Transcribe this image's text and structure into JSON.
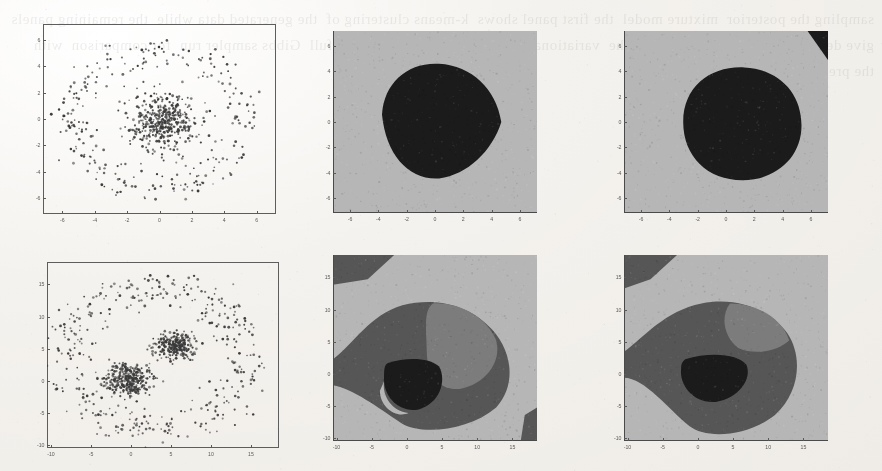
{
  "page": {
    "kind": "scanned-figure-page",
    "ghost_text": "sampling the posterior  mixture model  the first panel shows  k-means clustering of  the generated data while  the remaining panels  give decision regions  obtained from the  variational approximation  and from the full  Gibbs sampler run  for comparison  with  the predictive density",
    "background_color": "#f2f0ec",
    "ink_color": "#3a3a3a"
  },
  "figure": {
    "panels": [
      {
        "id": "panel-top-left",
        "name": "scatter-two-ring",
        "type": "scatter",
        "x": 43,
        "y": 24,
        "w": 233,
        "h": 190,
        "chart_data": {
          "type": "scatter",
          "title": "",
          "xlabel": "",
          "ylabel": "",
          "grid": false,
          "legend": null,
          "xlim": [
            -7.2,
            7.2
          ],
          "ylim": [
            -7.2,
            7.2
          ],
          "xticks": [
            -6,
            -4,
            -2,
            0,
            2,
            4,
            6
          ],
          "yticks": [
            -6,
            -4,
            -2,
            0,
            2,
            4,
            6
          ],
          "marker": "dot",
          "marker_color": "#3a3a3a",
          "marker_size": 1.1,
          "clusters": [
            {
              "name": "core-gaussian",
              "kind": "gaussian",
              "cx": 0.15,
              "cy": -0.1,
              "sx": 1.05,
              "sy": 1.05,
              "n": 430
            },
            {
              "name": "outer-ring",
              "kind": "ring",
              "cx": 0.0,
              "cy": 0.0,
              "r": 5.2,
              "rjitter": 0.62,
              "n": 260
            }
          ]
        }
      },
      {
        "id": "panel-top-mid",
        "name": "decision-region-two-class-a",
        "type": "region",
        "x": 333,
        "y": 31,
        "w": 204,
        "h": 182,
        "chart_data": {
          "type": "heatmap",
          "title": "",
          "xlabel": "",
          "ylabel": "",
          "grid": false,
          "xlim": [
            -7.2,
            7.2
          ],
          "ylim": [
            -7.2,
            7.2
          ],
          "xticks": [
            -6,
            -4,
            -2,
            0,
            2,
            4,
            6
          ],
          "yticks": [
            -6,
            -4,
            -2,
            0,
            2,
            4,
            6
          ],
          "levels": [
            {
              "label": "outer region",
              "color": "#b6b6b6"
            },
            {
              "label": "inner region",
              "color": "#1b1b1b"
            }
          ]
        }
      },
      {
        "id": "panel-top-right",
        "name": "decision-region-two-class-b",
        "type": "region",
        "x": 624,
        "y": 31,
        "w": 204,
        "h": 182,
        "chart_data": {
          "type": "heatmap",
          "title": "",
          "xlabel": "",
          "ylabel": "",
          "grid": false,
          "xlim": [
            -7.2,
            7.2
          ],
          "ylim": [
            -7.2,
            7.2
          ],
          "xticks": [
            -6,
            -4,
            -2,
            0,
            2,
            4,
            6
          ],
          "yticks": [
            -6,
            -4,
            -2,
            0,
            2,
            4,
            6
          ],
          "levels": [
            {
              "label": "outer region",
              "color": "#b6b6b6"
            },
            {
              "label": "inner region",
              "color": "#1b1b1b"
            }
          ]
        }
      },
      {
        "id": "panel-bot-left",
        "name": "scatter-two-cluster-ring",
        "type": "scatter",
        "x": 47,
        "y": 262,
        "w": 232,
        "h": 186,
        "chart_data": {
          "type": "scatter",
          "title": "",
          "xlabel": "",
          "ylabel": "",
          "grid": false,
          "legend": null,
          "xlim": [
            -10.5,
            18.5
          ],
          "ylim": [
            -10.5,
            18.5
          ],
          "xticks": [
            -10,
            -5,
            0,
            5,
            10,
            15
          ],
          "yticks": [
            -10,
            -5,
            0,
            5,
            10,
            15
          ],
          "marker": "dot",
          "marker_color": "#3a3a3a",
          "marker_size": 1.1,
          "clusters": [
            {
              "name": "cluster-lower-left",
              "kind": "gaussian",
              "cx": -0.4,
              "cy": 0.3,
              "sx": 1.5,
              "sy": 1.25,
              "n": 340
            },
            {
              "name": "cluster-upper-right",
              "kind": "gaussian",
              "cx": 5.4,
              "cy": 5.4,
              "sx": 1.25,
              "sy": 1.05,
              "n": 260
            },
            {
              "name": "outer-ring",
              "kind": "ring",
              "cx": 3.0,
              "cy": 3.4,
              "r": 11.2,
              "rjitter": 1.5,
              "n": 380
            }
          ]
        }
      },
      {
        "id": "panel-bot-mid",
        "name": "decision-region-multi-class-a",
        "type": "region",
        "x": 333,
        "y": 255,
        "w": 204,
        "h": 186,
        "chart_data": {
          "type": "heatmap",
          "title": "",
          "xlabel": "",
          "ylabel": "",
          "grid": false,
          "xlim": [
            -10.5,
            18.5
          ],
          "ylim": [
            -10.5,
            18.5
          ],
          "xticks": [
            -10,
            -5,
            0,
            5,
            10,
            15
          ],
          "yticks": [
            -10,
            -5,
            0,
            5,
            10,
            15
          ],
          "levels": [
            {
              "label": "background region",
              "color": "#b6b6b6"
            },
            {
              "label": "mid region",
              "color": "#7c7c7c"
            },
            {
              "label": "dark region",
              "color": "#565656"
            },
            {
              "label": "core region",
              "color": "#1b1b1b"
            }
          ]
        }
      },
      {
        "id": "panel-bot-right",
        "name": "decision-region-multi-class-b",
        "type": "region",
        "x": 624,
        "y": 255,
        "w": 204,
        "h": 186,
        "chart_data": {
          "type": "heatmap",
          "title": "",
          "xlabel": "",
          "ylabel": "",
          "grid": false,
          "xlim": [
            -10.5,
            18.5
          ],
          "ylim": [
            -10.5,
            18.5
          ],
          "xticks": [
            -10,
            -5,
            0,
            5,
            10,
            15
          ],
          "yticks": [
            -10,
            -5,
            0,
            5,
            10,
            15
          ],
          "levels": [
            {
              "label": "background region",
              "color": "#b6b6b6"
            },
            {
              "label": "mid region",
              "color": "#7c7c7c"
            },
            {
              "label": "dark region",
              "color": "#565656"
            },
            {
              "label": "core region",
              "color": "#1b1b1b"
            }
          ]
        }
      }
    ]
  }
}
